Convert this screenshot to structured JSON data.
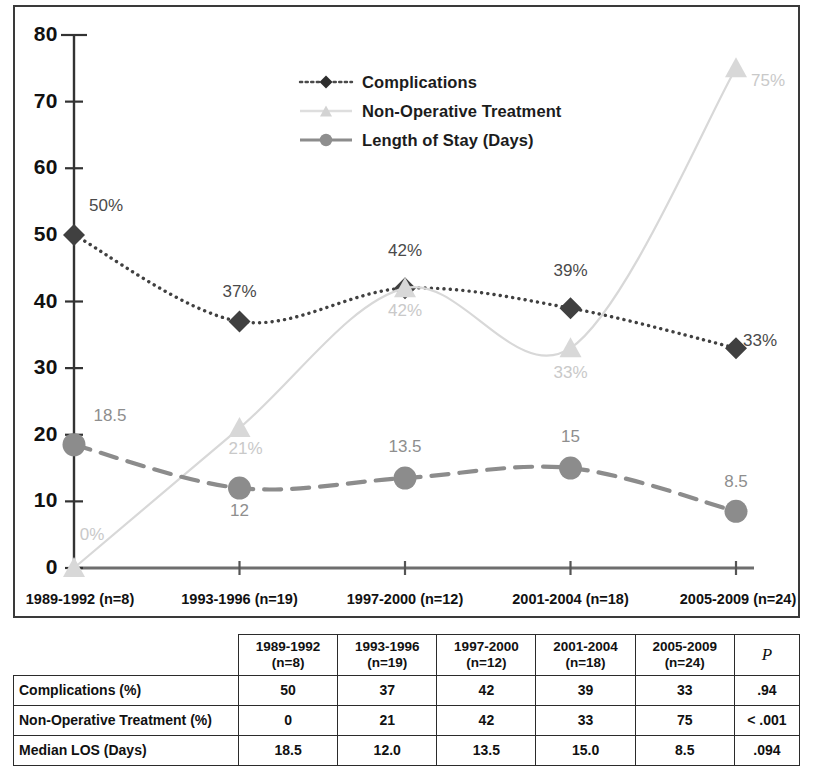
{
  "chart_data": {
    "type": "line",
    "title": "",
    "xlabel": "",
    "ylabel": "",
    "ylim": [
      0,
      80
    ],
    "yticks": [
      0,
      10,
      20,
      30,
      40,
      50,
      60,
      70,
      80
    ],
    "grid": false,
    "legend_position": "top-center",
    "categories": [
      "1989-1992 (n=8)",
      "1993-1996 (n=19)",
      "1997-2000 (n=12)",
      "2001-2004 (n=18)",
      "2005-2009 (n=24)"
    ],
    "series": [
      {
        "name": "Complications",
        "values": [
          50,
          37,
          42,
          39,
          33
        ],
        "point_labels": [
          "50%",
          "37%",
          "42%",
          "39%",
          "33%"
        ],
        "color": "#404040",
        "marker": "diamond",
        "line_style": "dotted"
      },
      {
        "name": "Non-Operative Treatment",
        "values": [
          0,
          21,
          42,
          33,
          75
        ],
        "point_labels": [
          "0%",
          "21%",
          "42%",
          "33%",
          "75%"
        ],
        "color": "#d8d8d8",
        "marker": "triangle",
        "line_style": "solid"
      },
      {
        "name": "Length of Stay (Days)",
        "values": [
          18.5,
          12,
          13.5,
          15,
          8.5
        ],
        "point_labels": [
          "18.5",
          "12",
          "13.5",
          "15",
          "8.5"
        ],
        "color": "#8c8c8c",
        "marker": "circle",
        "line_style": "dashed"
      }
    ]
  },
  "legend": {
    "items": [
      {
        "label": "Complications"
      },
      {
        "label": "Non-Operative Treatment"
      },
      {
        "label": "Length of Stay (Days)"
      }
    ]
  },
  "table": {
    "corner_label": "",
    "p_header": "P",
    "column_headers": [
      {
        "year": "1989-1992",
        "n": "(n=8)"
      },
      {
        "year": "1993-1996",
        "n": "(n=19)"
      },
      {
        "year": "1997-2000",
        "n": "(n=12)"
      },
      {
        "year": "2001-2004",
        "n": "(n=18)"
      },
      {
        "year": "2005-2009",
        "n": "(n=24)"
      }
    ],
    "rows": [
      {
        "label": "Complications (%)",
        "values": [
          "50",
          "37",
          "42",
          "39",
          "33"
        ],
        "p": ".94"
      },
      {
        "label": "Non-Operative Treatment (%)",
        "values": [
          "0",
          "21",
          "42",
          "33",
          "75"
        ],
        "p": "< .001"
      },
      {
        "label": "Median LOS (Days)",
        "values": [
          "18.5",
          "12.0",
          "13.5",
          "15.0",
          "8.5"
        ],
        "p": ".094"
      }
    ]
  }
}
